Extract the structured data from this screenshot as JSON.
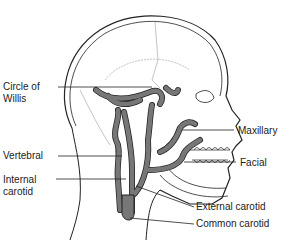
{
  "diagram": {
    "labels": [
      {
        "id": "circle-of-willis",
        "line1": "Circle of",
        "line2": "Willis"
      },
      {
        "id": "vertebral",
        "line1": "Vertebral"
      },
      {
        "id": "internal-carotid",
        "line1": "Internal",
        "line2": "carotid"
      },
      {
        "id": "maxillary",
        "line1": "Maxillary"
      },
      {
        "id": "facial",
        "line1": "Facial"
      },
      {
        "id": "external-carotid",
        "line1": "External carotid"
      },
      {
        "id": "common-carotid",
        "line1": "Common carotid"
      }
    ],
    "colors": {
      "artery": "#6e6e6e",
      "outline": "#222222",
      "bone": "#aaaaaa"
    }
  }
}
